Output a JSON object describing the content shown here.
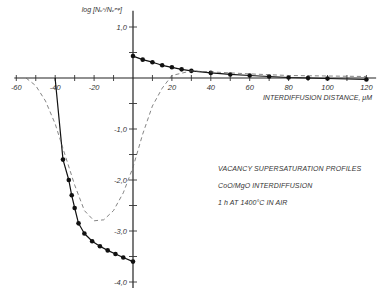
{
  "chart_data": {
    "type": "line",
    "title": "",
    "xlabel": "INTERDIFFUSION DISTANCE, μM",
    "ylabel": "log [Nᵥˢ/Nᵥᵉᵠ]",
    "xlim": [
      -60,
      125
    ],
    "ylim": [
      -4.0,
      1.2
    ],
    "grid": false,
    "x_ticks": [
      -60,
      -50,
      -40,
      -30,
      -20,
      -10,
      0,
      10,
      20,
      30,
      40,
      50,
      60,
      70,
      80,
      90,
      100,
      110,
      120
    ],
    "x_tick_labels": [
      {
        "value": -60,
        "label": "-60"
      },
      {
        "value": -40,
        "label": "-40"
      },
      {
        "value": -20,
        "label": "-20"
      },
      {
        "value": 20,
        "label": "20"
      },
      {
        "value": 40,
        "label": "40"
      },
      {
        "value": 60,
        "label": "60"
      },
      {
        "value": 80,
        "label": "80"
      },
      {
        "value": 100,
        "label": "100"
      },
      {
        "value": 120,
        "label": "120"
      }
    ],
    "y_ticks": [
      1.0,
      0.5,
      -0.5,
      -1.0,
      -1.5,
      -2.0,
      -2.5,
      -3.0,
      -3.5,
      -4.0
    ],
    "y_tick_labels": [
      {
        "value": 1.0,
        "label": "1,0"
      },
      {
        "value": -1.0,
        "label": "-1,0"
      },
      {
        "value": -2.0,
        "label": "-2,0"
      },
      {
        "value": -3.0,
        "label": "-3,0"
      },
      {
        "value": -4.0,
        "label": "-4,0"
      }
    ],
    "series": [
      {
        "name": "measured-positive-side",
        "style": "solid-markers",
        "x": [
          0,
          5,
          10,
          15,
          20,
          25,
          30,
          40,
          50,
          60,
          70,
          80,
          90,
          100,
          120
        ],
        "y": [
          0.43,
          0.36,
          0.31,
          0.25,
          0.21,
          0.17,
          0.14,
          0.1,
          0.07,
          0.05,
          0.03,
          0.01,
          0.0,
          -0.01,
          -0.03
        ]
      },
      {
        "name": "measured-negative-side",
        "style": "solid-markers",
        "x": [
          -36,
          -33,
          -31.5,
          -30,
          -28,
          -25,
          -21,
          -17,
          -13,
          -9,
          -5,
          0
        ],
        "y": [
          -1.6,
          -2.0,
          -2.3,
          -2.55,
          -2.85,
          -3.05,
          -3.2,
          -3.3,
          -3.38,
          -3.45,
          -3.52,
          -3.6
        ]
      },
      {
        "name": "measured-negative-side-edge",
        "style": "solid",
        "x": [
          -40,
          -40,
          -36
        ],
        "y": [
          0.0,
          -0.02,
          -1.6
        ]
      },
      {
        "name": "calculated",
        "style": "dashed",
        "x": [
          -55,
          -50,
          -45,
          -40,
          -35,
          -30,
          -25,
          -20,
          -15,
          -10,
          -5,
          0,
          5,
          10,
          15,
          20,
          30,
          40,
          60,
          80,
          100,
          120
        ],
        "y": [
          0.0,
          -0.15,
          -0.45,
          -0.9,
          -1.5,
          -2.1,
          -2.6,
          -2.8,
          -2.78,
          -2.6,
          -2.25,
          -1.75,
          -1.1,
          -0.55,
          -0.2,
          0.05,
          0.14,
          0.12,
          0.08,
          0.05,
          0.04,
          0.03
        ]
      }
    ],
    "annotations": [
      "VACANCY SUPERSATURATION PROFILES",
      "CoO/MgO INTERDIFFUSION",
      "1 h AT  1400°C  IN AIR"
    ]
  }
}
